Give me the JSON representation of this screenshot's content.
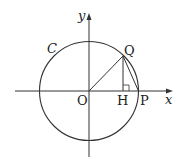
{
  "diagram": {
    "labels": {
      "y_axis": "y",
      "x_axis": "x",
      "circle": "C",
      "origin": "O",
      "point_q": "Q",
      "point_h": "H",
      "point_p": "P"
    },
    "colors": {
      "stroke": "#333333",
      "background": "#ffffff"
    }
  }
}
